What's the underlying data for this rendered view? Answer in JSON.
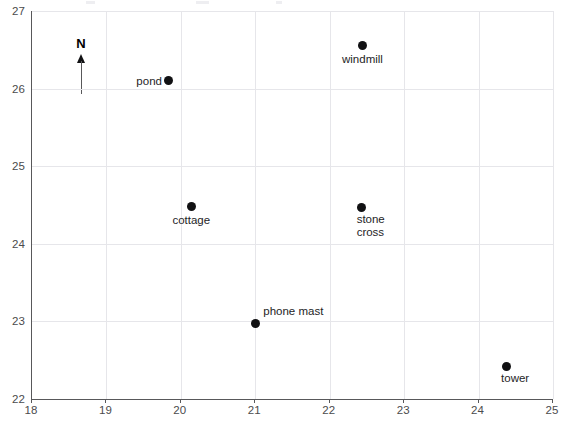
{
  "chart_data": {
    "type": "scatter",
    "title": "",
    "xlabel": "",
    "ylabel": "",
    "xlim": [
      18,
      25
    ],
    "ylim": [
      22,
      27
    ],
    "grid": true,
    "legend": false,
    "x_ticks": [
      "18",
      "19",
      "20",
      "21",
      "22",
      "23",
      "24",
      "25"
    ],
    "y_ticks": [
      "22",
      "23",
      "24",
      "25",
      "26",
      "27"
    ],
    "annotations": {
      "north_arrow": "N"
    },
    "points": [
      {
        "label": "pond",
        "x": 19.84,
        "y": 26.1,
        "label_pos": "left"
      },
      {
        "label": "windmill",
        "x": 22.44,
        "y": 26.55,
        "label_pos": "below"
      },
      {
        "label": "cottage",
        "x": 20.14,
        "y": 24.48,
        "label_pos": "below"
      },
      {
        "label": "stone\ncross",
        "x": 22.43,
        "y": 24.47,
        "label_pos": "below-right"
      },
      {
        "label": "phone mast",
        "x": 21.0,
        "y": 22.97,
        "label_pos": "above-right"
      },
      {
        "label": "tower",
        "x": 24.37,
        "y": 22.42,
        "label_pos": "below-right"
      }
    ],
    "colors": {
      "marker": "#111113",
      "axis": "#58585a",
      "grid": "#e6e6ea",
      "text": "#242426",
      "tick_text": "#4b4b4d",
      "background": "#ffffff"
    }
  }
}
